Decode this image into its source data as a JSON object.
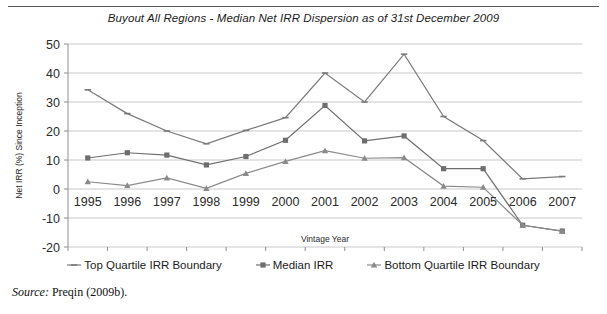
{
  "chart_data": {
    "type": "line",
    "title": "Buyout All Regions - Median Net IRR Dispersion as of 31st December 2009",
    "xlabel": "Vintage Year",
    "ylabel": "Net IRR (%) Since Inception",
    "categories": [
      "1995",
      "1996",
      "1997",
      "1998",
      "1999",
      "2000",
      "2001",
      "2002",
      "2003",
      "2004",
      "2005",
      "2006",
      "2007"
    ],
    "x": [
      1995,
      1996,
      1997,
      1998,
      1999,
      2000,
      2001,
      2002,
      2003,
      2004,
      2005,
      2006,
      2007
    ],
    "ylim": [
      -20,
      50
    ],
    "ytick_values": [
      50,
      40,
      30,
      20,
      10,
      0,
      -10,
      -20
    ],
    "ytick_labels": [
      "50",
      "40",
      "30",
      "20",
      "10",
      "0",
      "-10",
      "-20"
    ],
    "grid": true,
    "legend_position": "bottom",
    "series": [
      {
        "name": "Top Quartile IRR Boundary",
        "marker": "dash",
        "color": "#7a7a7a",
        "values": [
          34.2,
          26.0,
          20.0,
          15.6,
          20.2,
          24.6,
          40.0,
          30.0,
          46.5,
          25.0,
          16.7,
          3.5,
          4.3
        ]
      },
      {
        "name": "Median IRR",
        "marker": "square",
        "color": "#6e6e6e",
        "values": [
          10.7,
          12.5,
          11.7,
          8.3,
          11.2,
          16.8,
          28.8,
          16.6,
          18.3,
          7.0,
          7.0,
          -12.5,
          -14.5
        ]
      },
      {
        "name": "Bottom Quartile IRR Boundary",
        "marker": "triangle",
        "color": "#8a8a8a",
        "values": [
          2.5,
          1.2,
          3.8,
          0.2,
          5.4,
          9.5,
          13.2,
          10.6,
          10.8,
          1.0,
          0.6,
          -12.5,
          -14.5
        ]
      }
    ]
  },
  "source": {
    "label": "Source:",
    "text": "Preqin (2009b)."
  }
}
